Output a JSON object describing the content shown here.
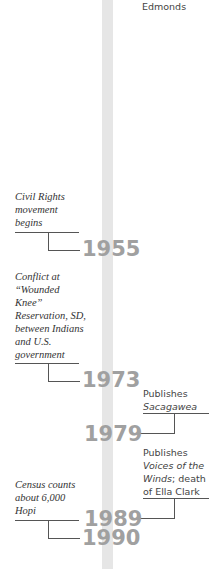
{
  "timeline": {
    "top_fragment": "Edmonds",
    "left_events": [
      {
        "year": "1955",
        "lines": [
          "Civil Rights",
          "movement",
          "begins"
        ]
      },
      {
        "year": "1973",
        "lines": [
          "Conflict at",
          "“Wounded",
          "Knee”",
          "Reservation, SD,",
          "between Indians",
          "and  U.S.",
          "government"
        ]
      },
      {
        "year": "1990",
        "lines": [
          "Census counts",
          "about 6,000",
          "Hopi"
        ]
      }
    ],
    "right_events": [
      {
        "year": "1979",
        "prefix": "Publishes",
        "title": "Sacagawea"
      },
      {
        "year": "1989",
        "prefix": "Publishes",
        "title_line1": "Voices of the",
        "title_line2": "Winds",
        "suffix": "; death",
        "line4": "of Ella Clark"
      }
    ]
  },
  "colors": {
    "bar": "#e6e6e6",
    "year": "#a0a0a0",
    "rule": "#555555"
  }
}
